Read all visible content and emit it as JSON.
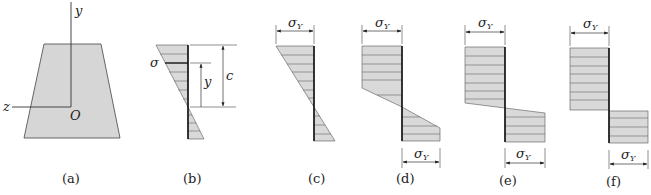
{
  "figure": {
    "colors": {
      "fill": "#d9d9d9",
      "line": "#333333",
      "hatch": "#555555",
      "baseline": "#111111"
    },
    "panels": [
      {
        "id": "a",
        "caption": "(a)",
        "axis_y": "y",
        "axis_z": "z",
        "origin": "O"
      },
      {
        "id": "b",
        "caption": "(b)",
        "stress_label": "σ",
        "dim_y": "y",
        "dim_c": "c"
      },
      {
        "id": "c",
        "caption": "(c)",
        "top_label": "σ",
        "top_sub": "Y"
      },
      {
        "id": "d",
        "caption": "(d)",
        "top_label": "σ",
        "top_sub": "Y",
        "bottom_label": "σ",
        "bottom_sub": "Y"
      },
      {
        "id": "e",
        "caption": "(e)",
        "top_label": "σ",
        "top_sub": "Y",
        "bottom_label": "σ",
        "bottom_sub": "Y"
      },
      {
        "id": "f",
        "caption": "(f)",
        "top_label": "σ",
        "top_sub": "Y",
        "bottom_label": "σ",
        "bottom_sub": "Y"
      }
    ]
  }
}
